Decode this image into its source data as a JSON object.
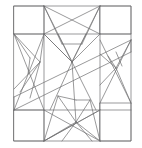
{
  "artwork": {
    "title": "Abstract geometric line drawing",
    "description": "Monochrome line-art composition of nested squares, triangles and star-burst fans crossed by a long diagonal band",
    "canvas": {
      "width": 142,
      "height": 148
    },
    "background_color": "#ffffff",
    "stroke_color": "#6f6f70",
    "stroke_color_light": "#9a9a9c",
    "stroke_width": 0.7
  },
  "geometry": {
    "frame": {
      "x1": 14,
      "y1": 6,
      "x2": 131,
      "y2": 141
    },
    "squares": [
      {
        "name": "top-left-square",
        "x1": 14,
        "y1": 6,
        "x2": 44,
        "y2": 34
      },
      {
        "name": "top-right-square",
        "x1": 100,
        "y1": 6,
        "x2": 131,
        "y2": 34
      },
      {
        "name": "bottom-left-square",
        "x1": 14,
        "y1": 110,
        "x2": 44,
        "y2": 141
      },
      {
        "name": "bottom-right-square",
        "x1": 100,
        "y1": 103,
        "x2": 131,
        "y2": 141
      },
      {
        "name": "top-center-square",
        "x1": 44,
        "y1": 6,
        "x2": 100,
        "y2": 34
      },
      {
        "name": "left-middle-block",
        "x1": 14,
        "y1": 34,
        "x2": 44,
        "y2": 110
      },
      {
        "name": "right-middle-block",
        "x1": 100,
        "y1": 34,
        "x2": 131,
        "y2": 103
      }
    ],
    "polylines": [
      {
        "name": "outer-frame",
        "points": "14,6 131,6 131,141 14,141 14,6"
      },
      {
        "name": "inner-grid-h-top",
        "points": "14,34 131,34"
      },
      {
        "name": "inner-grid-h-bottom",
        "points": "14,110 131,110"
      },
      {
        "name": "inner-grid-v-left",
        "points": "44,6 44,141"
      },
      {
        "name": "inner-grid-v-right",
        "points": "100,6 100,141"
      },
      {
        "name": "diagonal-band-upper",
        "points": "14,97 131,40"
      },
      {
        "name": "diagonal-band-lower",
        "points": "14,110 131,52"
      }
    ],
    "fans": [
      {
        "name": "top-center-fan",
        "apex": [
          72,
          62
        ],
        "rays": [
          [
            44,
            6
          ],
          [
            100,
            6
          ],
          [
            44,
            34
          ],
          [
            100,
            34
          ],
          [
            58,
            6
          ],
          [
            86,
            6
          ]
        ]
      },
      {
        "name": "bottom-center-fan",
        "apex": [
          76,
          122
        ],
        "rays": [
          [
            44,
            141
          ],
          [
            100,
            141
          ],
          [
            58,
            96
          ],
          [
            90,
            96
          ],
          [
            62,
            141
          ],
          [
            92,
            141
          ]
        ]
      },
      {
        "name": "left-fan",
        "apex": [
          40,
          62
        ],
        "rays": [
          [
            14,
            34
          ],
          [
            14,
            89
          ],
          [
            44,
            34
          ],
          [
            30,
            96
          ]
        ]
      },
      {
        "name": "right-fan",
        "apex": [
          116,
          68
        ],
        "rays": [
          [
            131,
            40
          ],
          [
            131,
            103
          ],
          [
            100,
            54
          ],
          [
            100,
            103
          ]
        ]
      }
    ],
    "crossings": [
      {
        "name": "top-square-cross",
        "points": "44,6 100,34 44,34 100,6"
      },
      {
        "name": "left-block-cross",
        "points": "14,34 44,110 14,110 44,34"
      },
      {
        "name": "right-block-cross",
        "points": "100,34 131,103 100,103 131,34"
      },
      {
        "name": "bottom-center-cross",
        "points": "44,110 100,141 44,141 100,110"
      }
    ]
  },
  "labels": {
    "caption": ""
  }
}
